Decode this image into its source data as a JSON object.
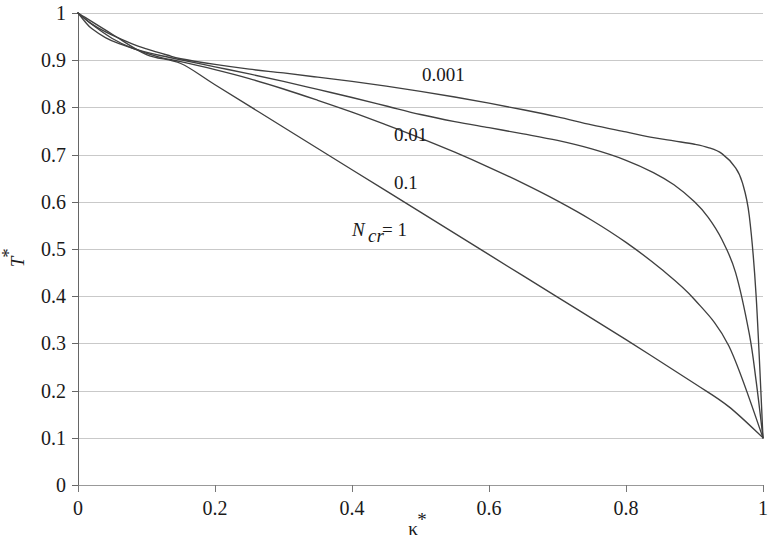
{
  "chart_data": {
    "type": "line",
    "title": "",
    "subtitle": "",
    "xlabel": "κ*",
    "ylabel": "T*",
    "xlim": [
      0,
      1
    ],
    "ylim": [
      0,
      1
    ],
    "grid": "horizontal",
    "legend_position": "inline-annotations",
    "x_ticks": [
      "0",
      "0.2",
      "0.4",
      "0.6",
      "0.8",
      "1"
    ],
    "x_tick_values": [
      0,
      0.2,
      0.4,
      0.6,
      0.8,
      1
    ],
    "y_ticks": [
      "0",
      "0.1",
      "0.2",
      "0.3",
      "0.4",
      "0.5",
      "0.6",
      "0.7",
      "0.8",
      "0.9",
      "1"
    ],
    "y_tick_values": [
      0,
      0.1,
      0.2,
      0.3,
      0.4,
      0.5,
      0.6,
      0.7,
      0.8,
      0.9,
      1.0
    ],
    "annotations": [
      {
        "text": "0.001",
        "x": 0.5,
        "y": 0.855,
        "style": "plain"
      },
      {
        "text": "0.01",
        "x": 0.455,
        "y": 0.725,
        "style": "plain"
      },
      {
        "text": "0.1",
        "x": 0.455,
        "y": 0.627,
        "style": "plain"
      },
      {
        "text": "N",
        "sub": "cr",
        "suffix": " = 1",
        "x": 0.405,
        "y": 0.525,
        "style": "italic-sub"
      }
    ],
    "line_color": "#404040",
    "grid_color": "#c9c9c9",
    "axis_color": "#555555",
    "background": "#ffffff",
    "series": [
      {
        "name": "0.001",
        "label": "0.001",
        "x": [
          0,
          0.01,
          0.02,
          0.03,
          0.05,
          0.08,
          0.1,
          0.13,
          0.15,
          0.2,
          0.25,
          0.3,
          0.35,
          0.4,
          0.45,
          0.5,
          0.55,
          0.6,
          0.65,
          0.7,
          0.75,
          0.8,
          0.84,
          0.87,
          0.9,
          0.92,
          0.94,
          0.96,
          0.97,
          0.98,
          0.99,
          1.0
        ],
        "values": [
          1.0,
          0.988,
          0.977,
          0.968,
          0.953,
          0.934,
          0.924,
          0.911,
          0.903,
          0.891,
          0.881,
          0.873,
          0.864,
          0.855,
          0.845,
          0.834,
          0.822,
          0.809,
          0.795,
          0.78,
          0.763,
          0.748,
          0.736,
          0.729,
          0.722,
          0.715,
          0.702,
          0.672,
          0.64,
          0.57,
          0.4,
          0.1
        ]
      },
      {
        "name": "0.01",
        "label": "0.01",
        "x": [
          0,
          0.01,
          0.02,
          0.04,
          0.06,
          0.09,
          0.12,
          0.15,
          0.2,
          0.25,
          0.3,
          0.35,
          0.4,
          0.45,
          0.5,
          0.55,
          0.6,
          0.65,
          0.7,
          0.75,
          0.8,
          0.84,
          0.87,
          0.9,
          0.92,
          0.94,
          0.96,
          0.98,
          0.99,
          1.0
        ],
        "values": [
          1.0,
          0.982,
          0.967,
          0.948,
          0.935,
          0.921,
          0.91,
          0.901,
          0.886,
          0.871,
          0.855,
          0.838,
          0.821,
          0.803,
          0.785,
          0.77,
          0.757,
          0.744,
          0.73,
          0.712,
          0.688,
          0.662,
          0.636,
          0.6,
          0.567,
          0.52,
          0.45,
          0.32,
          0.22,
          0.1
        ]
      },
      {
        "name": "0.1",
        "label": "0.1",
        "x": [
          0,
          0.02,
          0.05,
          0.08,
          0.12,
          0.15,
          0.2,
          0.25,
          0.3,
          0.35,
          0.4,
          0.45,
          0.5,
          0.55,
          0.6,
          0.65,
          0.7,
          0.75,
          0.8,
          0.85,
          0.9,
          0.95,
          1.0
        ],
        "values": [
          1.0,
          0.976,
          0.946,
          0.925,
          0.906,
          0.897,
          0.88,
          0.861,
          0.839,
          0.815,
          0.79,
          0.763,
          0.735,
          0.705,
          0.673,
          0.639,
          0.602,
          0.561,
          0.514,
          0.459,
          0.393,
          0.295,
          0.1
        ]
      },
      {
        "name": "N_cr = 1",
        "label": "N_cr = 1",
        "x": [
          0,
          0.05,
          0.1,
          0.15,
          0.2,
          0.3,
          0.4,
          0.5,
          0.6,
          0.7,
          0.8,
          0.9,
          0.95,
          1.0
        ],
        "values": [
          1.0,
          0.955,
          0.912,
          0.893,
          0.848,
          0.758,
          0.668,
          0.578,
          0.488,
          0.398,
          0.308,
          0.215,
          0.166,
          0.1
        ]
      }
    ]
  },
  "axes": {
    "x_title": "κ*",
    "y_title": "T*",
    "y_title_base": "T",
    "y_title_star": "*",
    "x_title_base": "κ",
    "x_title_star": "*"
  },
  "labels": {
    "curve_0001": "0.001",
    "curve_001": "0.01",
    "curve_01": "0.1",
    "curve_ncr_base": "N",
    "curve_ncr_sub": "cr",
    "curve_ncr_eq": " = 1"
  }
}
